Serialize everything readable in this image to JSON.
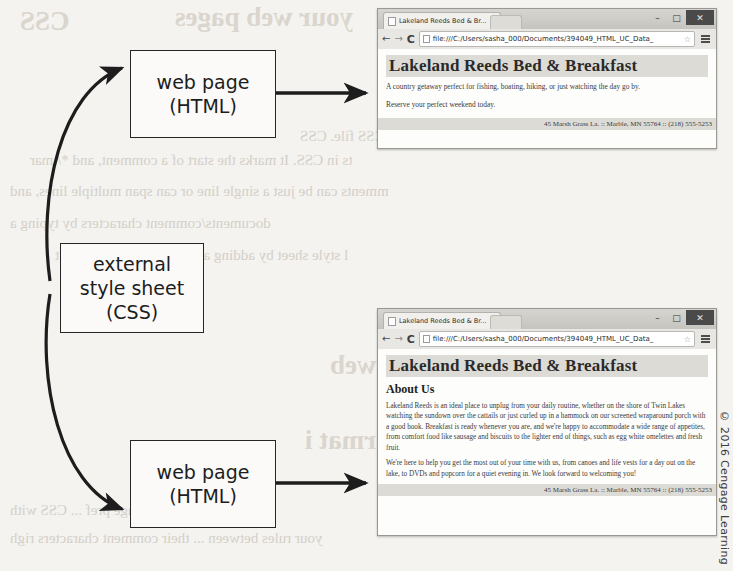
{
  "diagram": {
    "boxes": [
      {
        "name": "web-page-top",
        "line1": "web page",
        "line2": "(HTML)"
      },
      {
        "name": "external-css",
        "line1": "external",
        "line2": "style sheet",
        "line3": "(CSS)"
      },
      {
        "name": "web-page-bottom",
        "line1": "web page",
        "line2": "(HTML)"
      }
    ]
  },
  "browser": {
    "tab_title": "Lakeland Reeds Bed & Br...",
    "url": "file:///C:/Users/sasha_000/Documents/394049_HTML_UC_Data_",
    "back_label": "←",
    "forward_label": "→",
    "reload_label": "C",
    "star_label": "☆",
    "tab_close_label": "×",
    "window_buttons": {
      "minimize": "–",
      "maximize": "□",
      "close": "✕"
    }
  },
  "page_top": {
    "heading": "Lakeland Reeds Bed & Breakfast",
    "paragraph1": "A country getaway perfect for fishing, boating, hiking, or just watching the day go by.",
    "paragraph2": "Reserve your perfect weekend today.",
    "footer": "45 Marsh Grass La. :: Marble, MN 55764 :: (218) 555-5253"
  },
  "page_bottom": {
    "heading": "Lakeland Reeds Bed & Breakfast",
    "subheading": "About Us",
    "paragraph1": "Lakeland Reeds is an ideal place to unplug from your daily routine, whether on the shore of Twin Lakes watching the sundown over the cattails or just curled up in a hammock on our screened wraparound porch with a good book. Breakfast is ready whenever you are, and we're happy to accommodate a wide range of appetites, from comfort food like sausage and biscuits to the lighter end of things, such as egg white omelettes and fresh fruit.",
    "paragraph2": "We're here to help you get the most out of your time with us, from canoes and life vests for a day out on the lake, to DVDs and popcorn for a quiet evening in. We look forward to welcoming you!",
    "footer": "45 Marsh Grass La. :: Marble, MN 55764 :: (218) 555-5253"
  },
  "credit": "© 2016 Cengage Learning",
  "ghost_text": [
    {
      "text": "CSS",
      "x": 20,
      "y": 6,
      "size": "big"
    },
    {
      "text": "your web pages",
      "x": 175,
      "y": 2,
      "size": "big"
    },
    {
      "text": "to your own devi",
      "x": 400,
      "y": 86,
      "size": "med"
    },
    {
      "text": "small CSS file. CSS",
      "x": 300,
      "y": 128,
      "size": "med"
    },
    {
      "text": "ts in CSS. It marks the start of a comment, and */ mar",
      "x": 30,
      "y": 152,
      "size": "med"
    },
    {
      "text": "mments can be just a single line or can span multiple lines, and",
      "x": 10,
      "y": 183,
      "size": "med"
    },
    {
      "text": "documents/comment characters by typing a",
      "x": 10,
      "y": 215,
      "size": "med"
    },
    {
      "text": "l style sheet by adding a comment to the end edit",
      "x": 55,
      "y": 247,
      "size": "med"
    },
    {
      "text": "o style CSS in your web",
      "x": 330,
      "y": 350,
      "size": "big"
    },
    {
      "text": "that you format i",
      "x": 305,
      "y": 425,
      "size": "big"
    },
    {
      "text": "Nhen a page pref ... CSS with",
      "x": 10,
      "y": 502,
      "size": "med"
    },
    {
      "text": "your rules between ... their comment characters righ",
      "x": 10,
      "y": 530,
      "size": "med"
    }
  ],
  "colors": {
    "paper": "#f4f3f0",
    "ink": "#1d1d1d",
    "ghost": "#cfcac2",
    "browser_chrome": "#e9e7e3",
    "site_band": "#dddbd6"
  }
}
